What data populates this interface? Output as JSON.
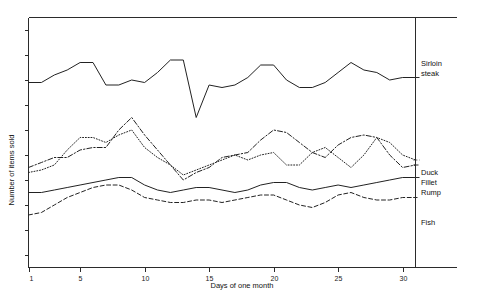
{
  "chart_data": {
    "type": "line",
    "title": "",
    "xlabel": "Days of one month",
    "ylabel": "Number of items sold",
    "grid": false,
    "legend_position": "right-inline",
    "xlim": [
      1,
      31
    ],
    "ylim": [
      0,
      100
    ],
    "xticks": [
      1,
      5,
      10,
      15,
      20,
      25,
      30
    ],
    "xticklabels": [
      "1",
      "5",
      "10",
      "15",
      "20",
      "25",
      "30"
    ],
    "yticks": [
      5,
      15,
      25,
      35,
      45,
      55,
      65,
      75,
      85,
      95
    ],
    "yticklabels": [
      "",
      "",
      "",
      "",
      "",
      "",
      "",
      "",
      "",
      ""
    ],
    "x": [
      1,
      2,
      3,
      4,
      5,
      6,
      7,
      8,
      9,
      10,
      11,
      12,
      13,
      14,
      15,
      16,
      17,
      18,
      19,
      20,
      21,
      22,
      23,
      24,
      25,
      26,
      27,
      28,
      29,
      30,
      31
    ],
    "series": [
      {
        "name": "Sirloin steak",
        "style": "solid",
        "legend_label": "Sirloin\nsteak",
        "values": [
          74,
          74,
          77,
          79,
          82,
          82,
          73,
          73,
          75,
          74,
          78,
          83,
          83,
          60,
          73,
          72,
          73,
          76,
          81,
          81,
          75,
          72,
          72,
          74,
          78,
          82,
          79,
          78,
          75,
          76,
          76
        ]
      },
      {
        "name": "Duck",
        "style": "dashdot",
        "legend_label": "Duck",
        "values": [
          40,
          42,
          44,
          44,
          47,
          48,
          48,
          55,
          60,
          53,
          47,
          41,
          35,
          38,
          40,
          44,
          45,
          46,
          51,
          55,
          54,
          50,
          46,
          44,
          49,
          52,
          53,
          52,
          45,
          40,
          41
        ]
      },
      {
        "name": "Fillet",
        "style": "dotted",
        "legend_label": "Fillet",
        "values": [
          38,
          39,
          41,
          47,
          52,
          52,
          50,
          53,
          55,
          48,
          44,
          41,
          37,
          39,
          41,
          43,
          45,
          43,
          45,
          46,
          41,
          41,
          46,
          48,
          44,
          40,
          45,
          52,
          50,
          45,
          43
        ]
      },
      {
        "name": "Rump",
        "style": "solid",
        "legend_label": "Rump",
        "values": [
          30,
          30,
          31,
          32,
          33,
          34,
          35,
          36,
          36,
          33,
          31,
          30,
          31,
          32,
          32,
          31,
          30,
          31,
          33,
          34,
          34,
          32,
          31,
          32,
          33,
          32,
          33,
          34,
          35,
          36,
          36
        ]
      },
      {
        "name": "Fish",
        "style": "dashed",
        "legend_label": "Fish",
        "values": [
          21,
          22,
          25,
          28,
          30,
          32,
          33,
          33,
          31,
          28,
          27,
          26,
          26,
          27,
          27,
          26,
          27,
          28,
          29,
          29,
          27,
          25,
          24,
          26,
          29,
          30,
          28,
          27,
          27,
          28,
          28
        ]
      }
    ]
  },
  "legend": {
    "sirloin_line1": "Sirloin",
    "sirloin_line2": "steak",
    "duck": "Duck",
    "fillet": "Fillet",
    "rump": "Rump",
    "fish": "Fish"
  },
  "axis": {
    "x_title": "Days of one month",
    "y_title": "Number of items sold",
    "x_labels": [
      "1",
      "5",
      "10",
      "15",
      "20",
      "25",
      "30"
    ]
  },
  "colors": {
    "ink": "#222222",
    "background": "#ffffff"
  }
}
